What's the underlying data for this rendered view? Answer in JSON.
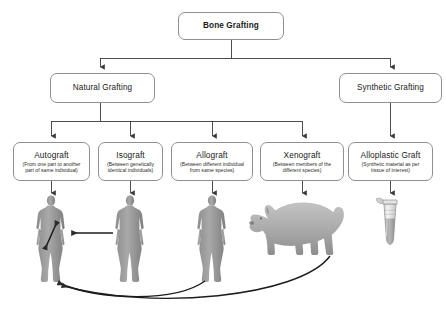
{
  "diagram": {
    "line_color": "#3a3a3a",
    "box_border_color": "#8f8f8f",
    "box_fill_color": "#ffffff",
    "figure_gray": "#9a9a9a"
  },
  "root": {
    "label": "Bone Grafting"
  },
  "level2": [
    {
      "label": "Natural Grafting"
    },
    {
      "label": "Synthetic Grafting"
    }
  ],
  "leaves": [
    {
      "label": "Autograft",
      "sub": "(From one part to another\npart of same individual)",
      "illustration": "human-figure-icon"
    },
    {
      "label": "Isograft",
      "sub": "(Between genetically\nidentical individuals)",
      "illustration": "human-figure-icon"
    },
    {
      "label": "Allograft",
      "sub": "(Between different individual\nfrom same species)",
      "illustration": "human-figure-icon"
    },
    {
      "label": "Xenograft",
      "sub": "(Between members of the\ndifferent species)",
      "illustration": "pig-icon"
    },
    {
      "label": "Alloplastic Graft",
      "sub": "(Synthetic material as per\ntissue of interest)",
      "illustration": "microcentrifuge-tube-icon"
    }
  ]
}
